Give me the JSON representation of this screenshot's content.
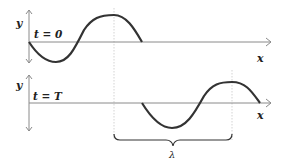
{
  "diagram": {
    "type": "traveling-wave-snapshots",
    "colors": {
      "wave": "#333333",
      "axis": "#8a8a8a",
      "guide": "#c8c8c8",
      "text": "#222222"
    },
    "panels": [
      {
        "id": "top",
        "time_label": "t = 0",
        "y_axis_label": "y",
        "x_axis_label": "x"
      },
      {
        "id": "bottom",
        "time_label": "t = T",
        "y_axis_label": "y",
        "x_axis_label": "x"
      }
    ],
    "wavelength_label": "λ"
  }
}
